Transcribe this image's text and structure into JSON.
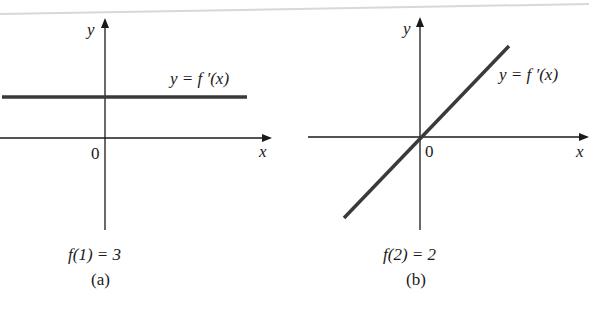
{
  "panels": [
    {
      "id": "a",
      "caption": "(a)",
      "condition": "f(1) = 3",
      "curve_label": "y = f ′(x)",
      "x_axis_label": "x",
      "y_axis_label": "y",
      "origin_label": "0",
      "curve_type": "horizontal line (constant positive)"
    },
    {
      "id": "b",
      "caption": "(b)",
      "condition": "f(2) = 2",
      "curve_label": "y = f ′(x)",
      "x_axis_label": "x",
      "y_axis_label": "y",
      "origin_label": "0",
      "curve_type": "line through origin (positive slope)"
    }
  ],
  "colors": {
    "axis": "#1a1a1a",
    "curve": "#3a3a3a",
    "background": "#ffffff"
  }
}
